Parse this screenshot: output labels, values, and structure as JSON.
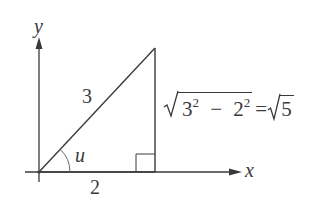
{
  "diagram": {
    "type": "right-triangle-on-axes",
    "axes": {
      "x_label": "x",
      "y_label": "y"
    },
    "triangle": {
      "hypotenuse_label": "3",
      "adjacent_label": "2",
      "opposite_label_formula": {
        "radicand_a": "3",
        "exp_a": "2",
        "minus": "−",
        "radicand_b": "2",
        "exp_b": "2",
        "equals": "=",
        "result_radicand": "5"
      },
      "angle_label": "u",
      "right_angle_marker": true
    },
    "colors": {
      "stroke": "#3a3a3a",
      "background": "#ffffff"
    }
  }
}
